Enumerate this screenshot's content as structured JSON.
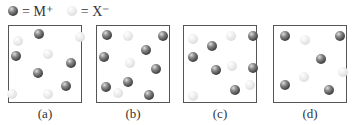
{
  "legend": [
    {
      "type": "dark",
      "label": "= M⁺"
    },
    {
      "type": "light",
      "label": "= X⁻"
    }
  ],
  "boxes": [
    {
      "caption": "(a)",
      "left": 8,
      "particles": [
        {
          "t": "dark",
          "x": 30,
          "y": 8
        },
        {
          "t": "dark",
          "x": 7,
          "y": 30
        },
        {
          "t": "dark",
          "x": 62,
          "y": 37
        },
        {
          "t": "dark",
          "x": 29,
          "y": 47
        },
        {
          "t": "dark",
          "x": 57,
          "y": 60
        },
        {
          "t": "light",
          "x": 9,
          "y": 15
        },
        {
          "t": "light",
          "x": 71,
          "y": 11
        },
        {
          "t": "light",
          "x": 39,
          "y": 28
        },
        {
          "t": "light",
          "x": 3,
          "y": 68
        },
        {
          "t": "light",
          "x": 39,
          "y": 68
        }
      ]
    },
    {
      "caption": "(b)",
      "left": 96,
      "particles": [
        {
          "t": "dark",
          "x": 10,
          "y": 9
        },
        {
          "t": "dark",
          "x": 66,
          "y": 10
        },
        {
          "t": "dark",
          "x": 49,
          "y": 24
        },
        {
          "t": "dark",
          "x": 7,
          "y": 31
        },
        {
          "t": "dark",
          "x": 59,
          "y": 43
        },
        {
          "t": "dark",
          "x": 31,
          "y": 56
        },
        {
          "t": "dark",
          "x": 9,
          "y": 61
        },
        {
          "t": "dark",
          "x": 52,
          "y": 69
        },
        {
          "t": "light",
          "x": 31,
          "y": 10
        },
        {
          "t": "light",
          "x": 33,
          "y": 37
        },
        {
          "t": "light",
          "x": 21,
          "y": 67
        }
      ]
    },
    {
      "caption": "(c)",
      "left": 183,
      "particles": [
        {
          "t": "dark",
          "x": 69,
          "y": 10
        },
        {
          "t": "dark",
          "x": 28,
          "y": 20
        },
        {
          "t": "dark",
          "x": 9,
          "y": 31
        },
        {
          "t": "dark",
          "x": 32,
          "y": 44
        },
        {
          "t": "dark",
          "x": 69,
          "y": 42
        },
        {
          "t": "dark",
          "x": 51,
          "y": 64
        },
        {
          "t": "light",
          "x": 9,
          "y": 13
        },
        {
          "t": "light",
          "x": 47,
          "y": 10
        },
        {
          "t": "light",
          "x": 48,
          "y": 40
        },
        {
          "t": "light",
          "x": 66,
          "y": 59
        },
        {
          "t": "light",
          "x": 9,
          "y": 70
        }
      ]
    },
    {
      "caption": "(d)",
      "left": 273,
      "particles": [
        {
          "t": "dark",
          "x": 11,
          "y": 10
        },
        {
          "t": "dark",
          "x": 66,
          "y": 10
        },
        {
          "t": "dark",
          "x": 47,
          "y": 33
        },
        {
          "t": "dark",
          "x": 11,
          "y": 59
        },
        {
          "t": "dark",
          "x": 55,
          "y": 64
        },
        {
          "t": "light",
          "x": 31,
          "y": 14
        },
        {
          "t": "light",
          "x": 69,
          "y": 46
        },
        {
          "t": "light",
          "x": 30,
          "y": 51
        }
      ]
    }
  ]
}
